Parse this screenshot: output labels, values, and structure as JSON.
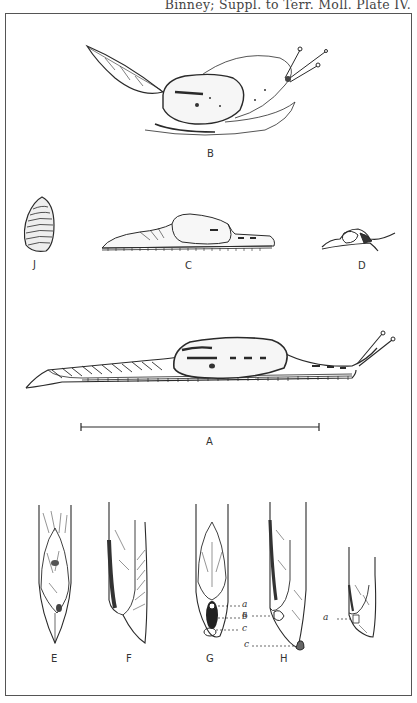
{
  "header": {
    "citation": "Binney; Suppl. to Terr. Moll. Plate IV."
  },
  "figures": {
    "A": {
      "label": "A",
      "description": "slug side view, full length, with scale bar"
    },
    "B": {
      "label": "B",
      "description": "slug with mantle shield, on leaf"
    },
    "C": {
      "label": "C",
      "description": "slug contracted, side view"
    },
    "D": {
      "label": "D",
      "description": "small slug, side view"
    },
    "E": {
      "label": "E",
      "description": "posterior tail, dorsal view"
    },
    "F": {
      "label": "F",
      "description": "posterior tail, lateral view"
    },
    "G": {
      "label": "G",
      "description": "posterior tail with caudal pore, dorsal view",
      "callouts": [
        "a",
        "b",
        "c"
      ]
    },
    "H": {
      "label": "H",
      "description": "posterior tail, lateral view with callouts",
      "callouts": [
        "a",
        "c"
      ]
    },
    "I": {
      "label": "",
      "description": "posterior tail, lateral, unlabeled",
      "callouts": [
        "a"
      ]
    },
    "J": {
      "label": "J",
      "description": "internal shell plate"
    }
  },
  "colors": {
    "ink": "#2a2a2a",
    "paper": "#ffffff",
    "frame": "#555555"
  }
}
